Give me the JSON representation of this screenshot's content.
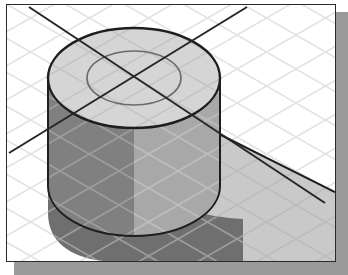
{
  "illustration": {
    "title": "Isometric cylinder with concentric circle and cast shadow",
    "caption": "",
    "frame": {
      "x": 6,
      "y": 4,
      "width": 330,
      "height": 258,
      "border_color": "#2a2a2a",
      "background_color": "#ffffff",
      "drop_shadow_color": "#9a9a9a",
      "drop_shadow_offset_x": 8,
      "drop_shadow_offset_y": 8
    },
    "colors": {
      "background": "#ffffff",
      "grid_line": "#e3e3e3",
      "grid_line_on_dark": "#9a9a9a",
      "cylinder_top_face": "#d5d5d5",
      "cylinder_body": "#a8a8a8",
      "cylinder_body_dark": "#808080",
      "cast_shadow_dark": "#6f6f6f",
      "floor_shadow_light": "#c9c9c9",
      "outline": "#1e1e1e",
      "inner_circle_outline": "#6a6a6a",
      "centerline": "#262626"
    },
    "geometry": {
      "grid": {
        "enabled": true,
        "style": "isometric-diamond",
        "spacing_px": 34,
        "angle_degrees": 30,
        "line_width": 1
      },
      "cylinder": {
        "center_x": 127,
        "center_y": 73,
        "outer_radius_x": 86,
        "outer_radius_y": 50,
        "inner_radius_x": 47,
        "inner_radius_y": 27,
        "height_px": 108,
        "top_face_visible": true,
        "inner_circle_visible": true
      },
      "centerlines": {
        "count": 2,
        "intersection_x": 127,
        "intersection_y": 73,
        "line_width": 2,
        "line_a_label": "descending-centerline",
        "line_b_label": "ascending-centerline"
      },
      "cast_shadow": {
        "direction": "down-right",
        "band_present": true
      }
    }
  }
}
